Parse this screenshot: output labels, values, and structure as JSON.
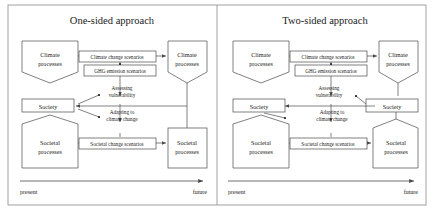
{
  "figure": {
    "type": "conceptual-diagram",
    "panels": [
      {
        "id": "one-sided",
        "title": "One-sided approach",
        "nodes": {
          "climate_present": "Climate\nprocesses",
          "climate_future": "Climate\nprocesses",
          "society_present": "Society",
          "societal_present": "Societal\nprocesses",
          "societal_future": "Societal\nprocesses"
        },
        "connector_labels": {
          "climate_change_scenarios": "Climate change scenarios",
          "ghg_emission_scenarios": "GHG emission scenarios",
          "assessing_vulnerability": "Assessing\nvulnerability",
          "adapting_to_climate_change": "Adapting to\nclimate change",
          "societal_change_scenarios": "Societal change scenarios"
        },
        "axis": {
          "start": "present",
          "end": "future"
        }
      },
      {
        "id": "two-sided",
        "title": "Two-sided approach",
        "nodes": {
          "climate_present": "Climate\nprocesses",
          "climate_future": "Climate\nprocesses",
          "society_present": "Society",
          "society_future": "Society",
          "societal_present": "Societal\nprocesses",
          "societal_future": "Societal\nprocesses"
        },
        "connector_labels": {
          "climate_change_scenarios": "Climate change scenarios",
          "ghg_emission_scenarios": "GHG emission scenarios",
          "assessing_vulnerability": "Assessing\nvulnerability",
          "adapting_to_climate_change": "Adapting to\nclimate change",
          "societal_change_scenarios": "Societal change scenarios"
        },
        "axis": {
          "start": "present",
          "end": "future"
        }
      }
    ],
    "colors": {
      "stroke": "#4a4a4a",
      "text": "#1a1a1a",
      "background": "#ffffff"
    }
  },
  "labels": {
    "climate_processes": "Climate",
    "climate_processes2": "processes",
    "society": "Society",
    "societal_processes": "Societal",
    "societal_processes2": "processes",
    "ccs": "Climate change scenarios",
    "ghg": "GHG emission scenarios",
    "av1": "Assessing",
    "av2": "vulnerability",
    "ad1": "Adapting to",
    "ad2": "climate change",
    "scs": "Societal change scenarios",
    "present": "present",
    "future": "future",
    "title_left": "One-sided approach",
    "title_right": "Two-sided approach"
  }
}
